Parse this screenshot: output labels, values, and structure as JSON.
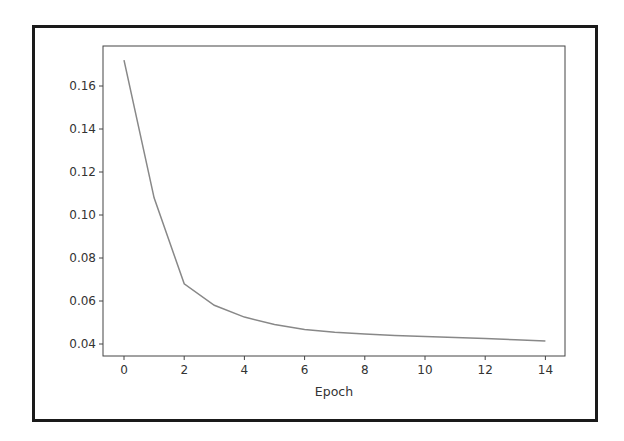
{
  "chart_data": {
    "type": "line",
    "title": "",
    "xlabel": "Epoch",
    "ylabel": "",
    "x": [
      0,
      1,
      2,
      3,
      4,
      5,
      6,
      7,
      8,
      9,
      10,
      11,
      12,
      13,
      14
    ],
    "series": [
      {
        "name": "loss",
        "color": "#888888",
        "values": [
          0.172,
          0.108,
          0.068,
          0.058,
          0.0525,
          0.049,
          0.0468,
          0.0455,
          0.0447,
          0.044,
          0.0435,
          0.043,
          0.0425,
          0.042,
          0.0414
        ]
      }
    ],
    "xticks": [
      0,
      2,
      4,
      6,
      8,
      10,
      12,
      14
    ],
    "xtick_labels": [
      "0",
      "2",
      "4",
      "6",
      "8",
      "10",
      "12",
      "14"
    ],
    "yticks": [
      0.04,
      0.06,
      0.08,
      0.1,
      0.12,
      0.14,
      0.16
    ],
    "ytick_labels": [
      "0.04",
      "0.06",
      "0.08",
      "0.10",
      "0.12",
      "0.14",
      "0.16"
    ],
    "xlim": [
      -0.7,
      14.7
    ],
    "ylim": [
      0.034,
      0.178
    ],
    "grid": false,
    "legend": null
  }
}
